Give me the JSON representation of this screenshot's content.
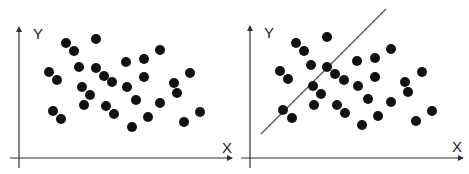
{
  "colors": {
    "dot": "#111111",
    "axis": "#333333",
    "line": "#555555",
    "background": "#ffffff"
  },
  "chart_data": [
    {
      "type": "scatter",
      "title": "",
      "xlabel": "X",
      "ylabel": "Y",
      "grid": false,
      "legend": null,
      "axes": {
        "x_axis": {
          "x1": 10,
          "x2": 232,
          "y": 158
        },
        "y_axis": {
          "x": 19,
          "y1": 168,
          "y2": 27
        },
        "xlabel_pos": [
          222,
          153
        ],
        "ylabel_pos": [
          33,
          39
        ]
      },
      "dot_radius": 5,
      "points": [
        [
          66,
          43
        ],
        [
          74,
          51
        ],
        [
          96,
          39
        ],
        [
          49,
          72
        ],
        [
          57,
          80
        ],
        [
          79,
          67
        ],
        [
          96,
          68
        ],
        [
          104,
          76
        ],
        [
          112,
          82
        ],
        [
          82,
          87
        ],
        [
          90,
          95
        ],
        [
          84,
          105
        ],
        [
          53,
          111
        ],
        [
          61,
          119
        ],
        [
          106,
          106
        ],
        [
          114,
          114
        ],
        [
          126,
          62
        ],
        [
          144,
          59
        ],
        [
          160,
          50
        ],
        [
          144,
          77
        ],
        [
          127,
          87
        ],
        [
          136,
          100
        ],
        [
          160,
          103
        ],
        [
          148,
          117
        ],
        [
          132,
          127
        ],
        [
          174,
          83
        ],
        [
          177,
          93
        ],
        [
          190,
          73
        ],
        [
          200,
          112
        ],
        [
          184,
          122
        ]
      ],
      "fit_line": null
    },
    {
      "type": "scatter",
      "title": "",
      "xlabel": "X",
      "ylabel": "Y",
      "grid": false,
      "legend": null,
      "axes": {
        "x_axis": {
          "x1": 241,
          "x2": 463,
          "y": 158
        },
        "y_axis": {
          "x": 250,
          "y1": 168,
          "y2": 26
        },
        "xlabel_pos": [
          452,
          152
        ],
        "ylabel_pos": [
          264,
          38
        ]
      },
      "dot_radius": 5,
      "points": [
        [
          296,
          43
        ],
        [
          304,
          51
        ],
        [
          327,
          37
        ],
        [
          280,
          71
        ],
        [
          288,
          79
        ],
        [
          311,
          65
        ],
        [
          327,
          67
        ],
        [
          335,
          74
        ],
        [
          344,
          80
        ],
        [
          313,
          86
        ],
        [
          321,
          94
        ],
        [
          314,
          105
        ],
        [
          283,
          110
        ],
        [
          292,
          118
        ],
        [
          337,
          105
        ],
        [
          345,
          113
        ],
        [
          357,
          61
        ],
        [
          375,
          58
        ],
        [
          391,
          49
        ],
        [
          375,
          77
        ],
        [
          358,
          86
        ],
        [
          368,
          99
        ],
        [
          391,
          102
        ],
        [
          378,
          116
        ],
        [
          362,
          125
        ],
        [
          405,
          82
        ],
        [
          408,
          92
        ],
        [
          422,
          72
        ],
        [
          432,
          111
        ],
        [
          416,
          121
        ]
      ],
      "fit_line": {
        "x1": 261,
        "y1": 134,
        "x2": 386,
        "y2": 9
      }
    }
  ]
}
